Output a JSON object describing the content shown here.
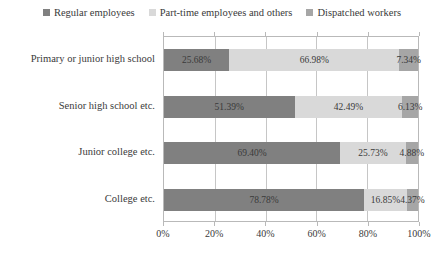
{
  "chart_data": {
    "type": "bar",
    "orientation": "horizontal",
    "stacked": true,
    "normalized": true,
    "title": "",
    "subtitle": "",
    "xlabel": "",
    "ylabel": "",
    "xlim": [
      0,
      100
    ],
    "grid": true,
    "legend_position": "top-center",
    "categories": [
      "Primary or junior high school",
      "Senior high school etc.",
      "Junior college etc.",
      "College etc."
    ],
    "series": [
      {
        "name": "Regular employees",
        "color": "#808080",
        "values": [
          25.68,
          51.39,
          69.4,
          78.78
        ],
        "labels": [
          "25.68%",
          "51.39%",
          "69.40%",
          "78.78%"
        ]
      },
      {
        "name": "Part-time employees and others",
        "color": "#d9d9d9",
        "values": [
          66.98,
          42.49,
          25.73,
          16.85
        ],
        "labels": [
          "66.98%",
          "42.49%",
          "25.73%",
          "16.85%"
        ]
      },
      {
        "name": "Dispatched workers",
        "color": "#a6a6a6",
        "values": [
          7.34,
          6.13,
          4.88,
          4.37
        ],
        "labels": [
          "7.34%",
          "6.13%",
          "4.88%",
          "4.37%"
        ]
      }
    ],
    "xticks": [
      0,
      20,
      40,
      60,
      80,
      100
    ],
    "xtick_labels": [
      "0%",
      "20%",
      "40%",
      "60%",
      "80%",
      "100%"
    ]
  },
  "legend": {
    "items": [
      {
        "label": "Regular employees",
        "color": "#808080"
      },
      {
        "label": "Part-time employees and others",
        "color": "#d9d9d9"
      },
      {
        "label": "Dispatched workers",
        "color": "#a6a6a6"
      }
    ]
  },
  "colors": {
    "regular": "#808080",
    "parttime": "#d9d9d9",
    "dispatched": "#a6a6a6",
    "axis": "#b9b9b9",
    "grid": "#c6c6c6",
    "text": "#3a3a3a",
    "background": "#ffffff"
  }
}
